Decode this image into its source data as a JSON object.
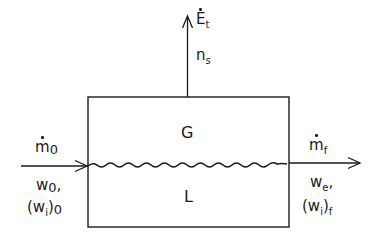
{
  "diagram": {
    "regions": {
      "gas": "G",
      "liquid": "L"
    },
    "top_stream": {
      "symbol": "E",
      "subscript": "t",
      "has_dot": true,
      "second_label": "n",
      "second_subscript": "s"
    },
    "inlet": {
      "symbol": "m",
      "subscript": "0",
      "has_dot": true,
      "line1_symbol": "w",
      "line1_subscript": "0",
      "line1_suffix": ",",
      "line2_prefix": "(w",
      "line2_inner_subscript": "i",
      "line2_close": ")",
      "line2_subscript": "0"
    },
    "outlet": {
      "symbol": "m",
      "subscript": "f",
      "has_dot": true,
      "line1_symbol": "w",
      "line1_subscript": "e",
      "line1_suffix": ",",
      "line2_prefix": "(w",
      "line2_inner_subscript": "i",
      "line2_close": ")",
      "line2_subscript": "f"
    },
    "colors": {
      "stroke": "#1a1a1a",
      "background": "#ffffff"
    }
  }
}
